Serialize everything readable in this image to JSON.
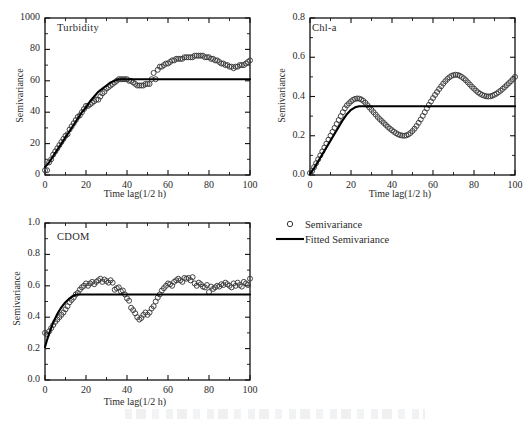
{
  "figure": {
    "background_color": "#ffffff",
    "ink_color": "#1a1a1a",
    "marker_color": "#3a3a3a",
    "line_color": "#000000"
  },
  "legend": {
    "position": "bottom-right",
    "entries": [
      {
        "symbol": "open-circle",
        "label": "Semivariance"
      },
      {
        "symbol": "solid-line",
        "label": "Fitted Semivariance"
      }
    ]
  },
  "chart_data": [
    {
      "type": "scatter",
      "title": "Turbidity",
      "xlabel": "Time lag(1/2 h)",
      "ylabel": "Semivariance",
      "xlim": [
        0,
        100
      ],
      "ylim": [
        0,
        100
      ],
      "xticks": [
        0,
        20,
        40,
        60,
        80,
        100
      ],
      "xtick_labels": [
        "0",
        "20",
        "40",
        "60",
        "80",
        "100"
      ],
      "yticks": [
        0,
        20,
        40,
        60,
        80,
        100
      ],
      "ytick_labels": [
        "0",
        "20",
        "40",
        "60",
        "80",
        "1000"
      ],
      "minor_tick_interval_x": 10,
      "minor_tick_interval_y": 10,
      "grid": false,
      "nugget": 3,
      "sill": 61,
      "range": 40,
      "series": [
        {
          "name": "Semivariance",
          "marker": "open-circle",
          "x": [
            0,
            1,
            2,
            3,
            4,
            5,
            6,
            7,
            8,
            9,
            10,
            11,
            12,
            13,
            14,
            15,
            16,
            17,
            18,
            19,
            20,
            21,
            22,
            23,
            24,
            25,
            26,
            27,
            28,
            29,
            30,
            31,
            32,
            33,
            34,
            35,
            36,
            37,
            38,
            39,
            40,
            41,
            42,
            43,
            44,
            45,
            46,
            47,
            48,
            49,
            50,
            51,
            52,
            53,
            54,
            55,
            56,
            57,
            58,
            59,
            60,
            61,
            62,
            63,
            64,
            65,
            66,
            67,
            68,
            69,
            70,
            71,
            72,
            73,
            74,
            75,
            76,
            77,
            78,
            79,
            80,
            81,
            82,
            83,
            84,
            85,
            86,
            87,
            88,
            89,
            90,
            91,
            92,
            93,
            94,
            95,
            96,
            97,
            98,
            99,
            100
          ],
          "y": [
            3,
            3,
            8,
            10,
            13,
            15,
            17,
            19,
            21,
            23,
            25,
            26,
            29,
            31,
            33,
            35,
            37,
            38,
            40,
            42,
            44,
            44,
            45,
            46,
            47,
            48,
            48,
            50,
            52,
            53,
            55,
            56,
            57,
            58,
            59,
            60,
            61,
            61,
            61,
            61,
            61,
            60,
            60,
            59,
            58,
            57,
            57,
            57,
            57,
            58,
            58,
            58,
            61,
            65,
            61,
            67,
            69,
            69,
            70,
            71,
            71,
            72,
            73,
            73,
            74,
            74,
            74,
            74,
            75,
            75,
            75,
            75,
            75,
            76,
            76,
            76,
            76,
            76,
            75,
            75,
            75,
            74,
            74,
            73,
            73,
            72,
            71,
            71,
            70,
            70,
            69,
            69,
            68,
            69,
            69,
            70,
            70,
            70,
            71,
            72,
            73
          ]
        },
        {
          "name": "Fitted Semivariance",
          "marker": "solid-line",
          "x": [
            0,
            2,
            4,
            6,
            8,
            10,
            12,
            14,
            16,
            18,
            20,
            22,
            24,
            26,
            28,
            30,
            32,
            34,
            36,
            38,
            40,
            45,
            50,
            60,
            70,
            80,
            90,
            100
          ],
          "y": [
            5,
            8,
            12,
            16,
            20,
            24,
            28,
            32,
            36,
            40,
            43,
            47,
            50,
            53,
            55,
            57,
            59,
            60,
            61,
            61,
            61,
            61,
            61,
            61,
            61,
            61,
            61,
            61
          ]
        }
      ]
    },
    {
      "type": "scatter",
      "title": "Chl-a",
      "xlabel": "Time lag(1/2 h)",
      "ylabel": "Semivariance",
      "xlim": [
        0,
        100
      ],
      "ylim": [
        0,
        0.8
      ],
      "xticks": [
        0,
        20,
        40,
        60,
        80,
        100
      ],
      "xtick_labels": [
        "0",
        "20",
        "40",
        "60",
        "80",
        "100"
      ],
      "yticks": [
        0.0,
        0.2,
        0.4,
        0.6,
        0.8
      ],
      "ytick_labels": [
        "0.0",
        "0.2",
        "0.4",
        "0.6",
        "0.8"
      ],
      "minor_tick_interval_x": 10,
      "minor_tick_interval_y": 0.1,
      "grid": false,
      "nugget": 0.01,
      "sill": 0.35,
      "range": 24,
      "series": [
        {
          "name": "Semivariance",
          "marker": "open-circle",
          "x": [
            0,
            1,
            2,
            3,
            4,
            5,
            6,
            7,
            8,
            9,
            10,
            11,
            12,
            13,
            14,
            15,
            16,
            17,
            18,
            19,
            20,
            21,
            22,
            23,
            24,
            25,
            26,
            27,
            28,
            29,
            30,
            31,
            32,
            33,
            34,
            35,
            36,
            37,
            38,
            39,
            40,
            41,
            42,
            43,
            44,
            45,
            46,
            47,
            48,
            49,
            50,
            51,
            52,
            53,
            54,
            55,
            56,
            57,
            58,
            59,
            60,
            61,
            62,
            63,
            64,
            65,
            66,
            67,
            68,
            69,
            70,
            71,
            72,
            73,
            74,
            75,
            76,
            77,
            78,
            79,
            80,
            81,
            82,
            83,
            84,
            85,
            86,
            87,
            88,
            89,
            90,
            91,
            92,
            93,
            94,
            95,
            96,
            97,
            98,
            99,
            100
          ],
          "y": [
            0.01,
            0.02,
            0.04,
            0.06,
            0.08,
            0.1,
            0.12,
            0.14,
            0.16,
            0.18,
            0.2,
            0.22,
            0.24,
            0.26,
            0.28,
            0.3,
            0.32,
            0.34,
            0.355,
            0.365,
            0.375,
            0.383,
            0.388,
            0.39,
            0.389,
            0.385,
            0.378,
            0.368,
            0.356,
            0.344,
            0.332,
            0.32,
            0.308,
            0.296,
            0.285,
            0.275,
            0.265,
            0.255,
            0.245,
            0.236,
            0.228,
            0.22,
            0.213,
            0.207,
            0.203,
            0.201,
            0.2,
            0.202,
            0.207,
            0.214,
            0.224,
            0.236,
            0.25,
            0.266,
            0.283,
            0.301,
            0.32,
            0.339,
            0.357,
            0.375,
            0.392,
            0.408,
            0.423,
            0.438,
            0.452,
            0.466,
            0.478,
            0.489,
            0.498,
            0.505,
            0.509,
            0.511,
            0.51,
            0.506,
            0.5,
            0.492,
            0.483,
            0.472,
            0.461,
            0.45,
            0.44,
            0.43,
            0.421,
            0.414,
            0.408,
            0.404,
            0.401,
            0.4,
            0.401,
            0.404,
            0.409,
            0.415,
            0.422,
            0.43,
            0.439,
            0.448,
            0.458,
            0.468,
            0.478,
            0.489,
            0.5
          ]
        },
        {
          "name": "Fitted Semivariance",
          "marker": "solid-line",
          "x": [
            0,
            2,
            4,
            6,
            8,
            10,
            12,
            14,
            16,
            18,
            20,
            22,
            24,
            26,
            30,
            40,
            50,
            60,
            70,
            80,
            90,
            100
          ],
          "y": [
            0.005,
            0.035,
            0.07,
            0.105,
            0.14,
            0.175,
            0.21,
            0.245,
            0.28,
            0.31,
            0.332,
            0.345,
            0.35,
            0.35,
            0.35,
            0.35,
            0.35,
            0.35,
            0.35,
            0.35,
            0.35,
            0.35
          ]
        }
      ]
    },
    {
      "type": "scatter",
      "title": "CDOM",
      "xlabel": "Time lag(1/2 h)",
      "ylabel": "Semivariance",
      "xlim": [
        0,
        100
      ],
      "ylim": [
        0,
        1.0
      ],
      "xticks": [
        0,
        20,
        40,
        60,
        80,
        100
      ],
      "xtick_labels": [
        "0",
        "20",
        "40",
        "60",
        "80",
        "100"
      ],
      "yticks": [
        0.0,
        0.2,
        0.4,
        0.6,
        0.8,
        1.0
      ],
      "ytick_labels": [
        "0.0",
        "0.2",
        "0.4",
        "0.6",
        "0.8",
        "1.0"
      ],
      "minor_tick_interval_x": 10,
      "minor_tick_interval_y": 0.1,
      "grid": false,
      "nugget": 0.21,
      "sill": 0.545,
      "range": 16,
      "series": [
        {
          "name": "Semivariance",
          "marker": "open-circle",
          "x": [
            0,
            1,
            2,
            3,
            4,
            5,
            6,
            7,
            8,
            9,
            10,
            11,
            12,
            13,
            14,
            15,
            16,
            17,
            18,
            19,
            20,
            21,
            22,
            23,
            24,
            25,
            26,
            27,
            28,
            29,
            30,
            31,
            32,
            33,
            34,
            35,
            36,
            37,
            38,
            39,
            40,
            41,
            42,
            43,
            44,
            45,
            46,
            47,
            48,
            49,
            50,
            51,
            52,
            53,
            54,
            55,
            56,
            57,
            58,
            59,
            60,
            61,
            62,
            63,
            64,
            65,
            66,
            67,
            68,
            69,
            70,
            71,
            72,
            73,
            74,
            75,
            76,
            77,
            78,
            79,
            80,
            81,
            82,
            83,
            84,
            85,
            86,
            87,
            88,
            89,
            90,
            91,
            92,
            93,
            94,
            95,
            96,
            97,
            98,
            99,
            100
          ],
          "y": [
            0.3,
            0.29,
            0.31,
            0.33,
            0.35,
            0.37,
            0.385,
            0.4,
            0.415,
            0.43,
            0.45,
            0.47,
            0.495,
            0.51,
            0.525,
            0.545,
            0.555,
            0.575,
            0.59,
            0.6,
            0.615,
            0.6,
            0.615,
            0.625,
            0.61,
            0.625,
            0.635,
            0.645,
            0.625,
            0.64,
            0.63,
            0.62,
            0.635,
            0.62,
            0.575,
            0.585,
            0.59,
            0.565,
            0.57,
            0.545,
            0.52,
            0.505,
            0.46,
            0.445,
            0.425,
            0.4,
            0.385,
            0.395,
            0.415,
            0.43,
            0.415,
            0.43,
            0.455,
            0.47,
            0.5,
            0.525,
            0.545,
            0.57,
            0.585,
            0.6,
            0.615,
            0.61,
            0.6,
            0.625,
            0.635,
            0.645,
            0.635,
            0.625,
            0.65,
            0.645,
            0.65,
            0.635,
            0.655,
            0.615,
            0.6,
            0.62,
            0.61,
            0.595,
            0.59,
            0.605,
            0.56,
            0.595,
            0.58,
            0.59,
            0.6,
            0.595,
            0.61,
            0.605,
            0.62,
            0.61,
            0.6,
            0.59,
            0.615,
            0.6,
            0.62,
            0.605,
            0.595,
            0.625,
            0.615,
            0.605,
            0.645
          ]
        },
        {
          "name": "Fitted Semivariance",
          "marker": "solid-line",
          "x": [
            0,
            1,
            2,
            3,
            4,
            5,
            6,
            7,
            8,
            9,
            10,
            11,
            12,
            13,
            14,
            15,
            16,
            20,
            30,
            40,
            50,
            60,
            70,
            80,
            90,
            100
          ],
          "y": [
            0.21,
            0.255,
            0.295,
            0.332,
            0.365,
            0.394,
            0.42,
            0.443,
            0.463,
            0.48,
            0.495,
            0.508,
            0.52,
            0.53,
            0.538,
            0.543,
            0.545,
            0.545,
            0.545,
            0.545,
            0.545,
            0.545,
            0.545,
            0.545,
            0.545,
            0.545
          ]
        }
      ]
    }
  ]
}
